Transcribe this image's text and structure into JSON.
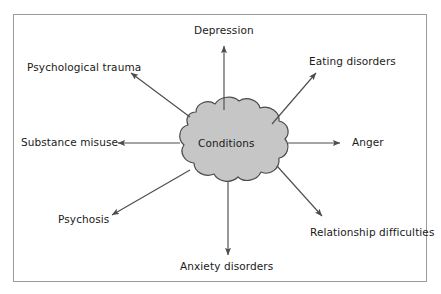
{
  "figure": {
    "type": "radial-concept-diagram",
    "title": "",
    "center": {
      "label": "Conditions",
      "shape": "cloud",
      "fill_color": "#c6c6c6",
      "stroke_color": "#4a4a4a"
    },
    "frame": {
      "border_color": "#9a9a9a",
      "background_color": "#ffffff"
    },
    "arrow_color": "#4d4d4d",
    "text_color": "#1a1a1a",
    "nodes": [
      {
        "id": "depression",
        "label": "Depression",
        "direction": "up"
      },
      {
        "id": "eating-disorders",
        "label": "Eating disorders",
        "direction": "up-right"
      },
      {
        "id": "anger",
        "label": "Anger",
        "direction": "right"
      },
      {
        "id": "relationship-difficulties",
        "label": "Relationship difficulties",
        "direction": "down-right"
      },
      {
        "id": "anxiety-disorders",
        "label": "Anxiety disorders",
        "direction": "down"
      },
      {
        "id": "psychosis",
        "label": "Psychosis",
        "direction": "down-left"
      },
      {
        "id": "substance-misuse",
        "label": "Substance misuse",
        "direction": "left"
      },
      {
        "id": "psychological-trauma",
        "label": "Psychological trauma",
        "direction": "up-left"
      }
    ]
  }
}
